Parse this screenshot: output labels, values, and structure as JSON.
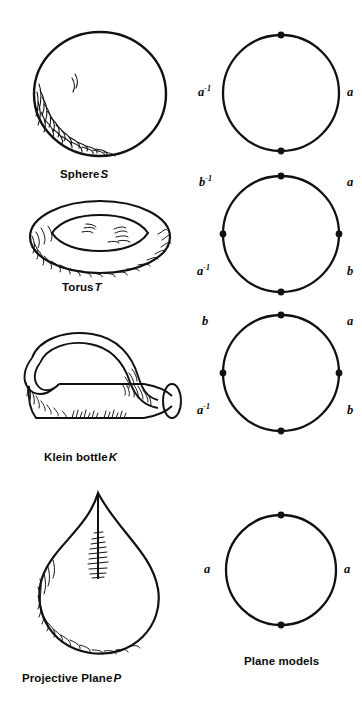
{
  "figure": {
    "title_right_column": "Plane models",
    "surfaces": [
      {
        "id": "sphere",
        "caption_text": "Sphere",
        "caption_symbol": "S",
        "icon": "sphere-drawing"
      },
      {
        "id": "torus",
        "caption_text": "Torus",
        "caption_symbol": "T",
        "icon": "torus-drawing"
      },
      {
        "id": "klein-bottle",
        "caption_text": "Klein bottle",
        "caption_symbol": "K",
        "icon": "klein-bottle-drawing"
      },
      {
        "id": "projective-plane",
        "caption_text": "Projective Plane",
        "caption_symbol": "P",
        "icon": "projective-plane-drawing"
      }
    ],
    "plane_models": [
      {
        "id": "sphere-plane-model",
        "for_surface": "Sphere S",
        "vertex_count": 2,
        "vertex_positions": [
          "top",
          "bottom"
        ],
        "labels": {
          "upper_left": "",
          "left": "a",
          "left_exponent": "-1",
          "right": "a",
          "right_exponent": "",
          "lower_left": "",
          "lower_right": ""
        },
        "boundary_word": "a a-1"
      },
      {
        "id": "torus-plane-model",
        "for_surface": "Torus T",
        "vertex_count": 4,
        "vertex_positions": [
          "top",
          "right",
          "bottom",
          "left"
        ],
        "labels": {
          "upper_left": "b",
          "upper_left_exponent": "-1",
          "upper_right": "a",
          "upper_right_exponent": "",
          "lower_left": "a",
          "lower_left_exponent": "-1",
          "lower_right": "b",
          "lower_right_exponent": ""
        },
        "boundary_word": "a b a-1 b-1"
      },
      {
        "id": "klein-bottle-plane-model",
        "for_surface": "Klein bottle K",
        "vertex_count": 4,
        "vertex_positions": [
          "top",
          "right",
          "bottom",
          "left"
        ],
        "labels": {
          "upper_left": "b",
          "upper_left_exponent": "",
          "upper_right": "a",
          "upper_right_exponent": "",
          "lower_left": "a",
          "lower_left_exponent": "-1",
          "lower_right": "b",
          "lower_right_exponent": ""
        },
        "boundary_word": "a b a-1 b"
      },
      {
        "id": "projective-plane-plane-model",
        "for_surface": "Projective Plane P",
        "vertex_count": 2,
        "vertex_positions": [
          "top",
          "bottom"
        ],
        "labels": {
          "left": "a",
          "left_exponent": "",
          "right": "a",
          "right_exponent": ""
        },
        "boundary_word": "a a"
      }
    ],
    "colors": {
      "ink": "#111111",
      "background": "#ffffff",
      "text": "#0a0a0a"
    }
  }
}
